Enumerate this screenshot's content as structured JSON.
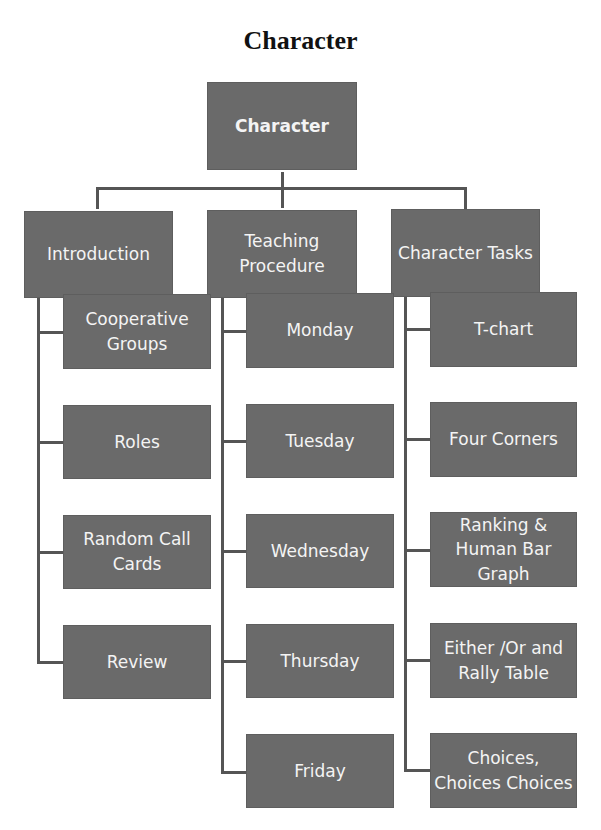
{
  "title": "Character",
  "root": {
    "label": "Character"
  },
  "columns": [
    {
      "label": "Introduction",
      "children": [
        "Cooperative Groups",
        "Roles",
        "Random Call Cards",
        "Review"
      ]
    },
    {
      "label": "Teaching Procedure",
      "children": [
        "Monday",
        "Tuesday",
        "Wednesday",
        "Thursday",
        "Friday"
      ]
    },
    {
      "label": "Character Tasks",
      "children": [
        "T-chart",
        "Four Corners",
        "Ranking & Human Bar Graph",
        "Either /Or and Rally Table",
        "Choices, Choices Choices"
      ]
    }
  ],
  "colors": {
    "box": "#6a6a6a",
    "text": "#f4f4f4",
    "line": "#555555"
  }
}
